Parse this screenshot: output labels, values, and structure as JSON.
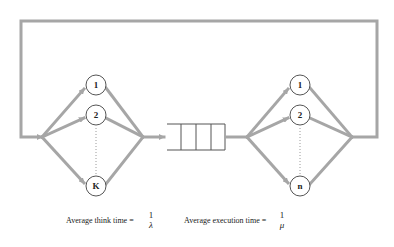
{
  "diagram": {
    "type": "closed queueing network",
    "colors": {
      "edge": "#a6a6a6",
      "node_border": "#555555",
      "text": "#222222"
    },
    "think_stations": {
      "labels": [
        "1",
        "2",
        "K"
      ]
    },
    "execution_servers": {
      "labels": [
        "1",
        "2",
        "n"
      ]
    },
    "queue": {
      "slots": 4
    }
  },
  "captions": {
    "think": {
      "label": "Average think time =",
      "numerator": "1",
      "denominator": "λ"
    },
    "exec": {
      "label": "Average execution time =",
      "numerator": "1",
      "denominator": "μ"
    }
  }
}
